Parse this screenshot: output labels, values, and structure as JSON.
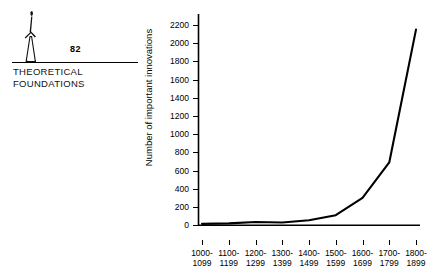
{
  "chapter": {
    "number": "82",
    "title_line1": "THEORETICAL",
    "title_line2": "FOUNDATIONS",
    "icon_name": "obelisk-figure-icon"
  },
  "chart_data": {
    "type": "line",
    "title": "",
    "xlabel": "",
    "ylabel": "Number of important innovations",
    "categories": [
      "1000-\n1099",
      "1100-\n1199",
      "1200-\n1299",
      "1300-\n1399",
      "1400-\n1499",
      "1500-\n1599",
      "1600-\n1699",
      "1700-\n1799",
      "1800-\n1899"
    ],
    "x_tick_labels_line1": [
      "1000-",
      "1100-",
      "1200-",
      "1300-",
      "1400-",
      "1500-",
      "1600-",
      "1700-",
      "1800-"
    ],
    "x_tick_labels_line2": [
      "1099",
      "1199",
      "1299",
      "1399",
      "1499",
      "1599",
      "1699",
      "1799",
      "1899"
    ],
    "values": [
      15,
      20,
      35,
      30,
      55,
      110,
      300,
      690,
      2150
    ],
    "y_tick_labels": [
      "0",
      "200",
      "400",
      "600",
      "800",
      "1000",
      "1200",
      "1400",
      "1600",
      "1800",
      "2000",
      "2200"
    ],
    "y_tick_values": [
      0,
      200,
      400,
      600,
      800,
      1000,
      1200,
      1400,
      1600,
      1800,
      2000,
      2200
    ],
    "ylim": [
      0,
      2300
    ],
    "grid": false,
    "legend": false,
    "line_color": "#000000"
  }
}
